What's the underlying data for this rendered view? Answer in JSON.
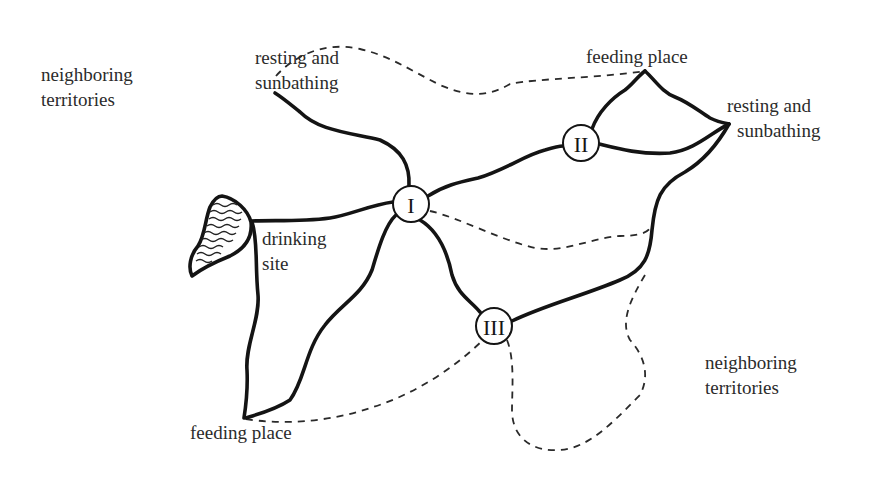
{
  "diagram": {
    "type": "territory-map",
    "nodes": [
      {
        "id": "I",
        "label": "I"
      },
      {
        "id": "II",
        "label": "II"
      },
      {
        "id": "III",
        "label": "III"
      }
    ],
    "labels": {
      "neighboring_top_left": [
        "neighboring",
        "territories"
      ],
      "resting_top_left": [
        "resting and",
        "sunbathing"
      ],
      "feeding_top_right": "feeding place",
      "resting_right": [
        "resting and",
        "sunbathing"
      ],
      "drinking_site": [
        "drinking",
        "site"
      ],
      "feeding_bottom_left": "feeding place",
      "neighboring_bottom_right": [
        "neighboring",
        "territories"
      ]
    },
    "legend_styles": {
      "solid_line": "paths within home territory",
      "dashed_line": "territory boundary"
    },
    "colors": {
      "ink": "#141414",
      "text": "#2b2b2b",
      "background": "#ffffff"
    }
  }
}
